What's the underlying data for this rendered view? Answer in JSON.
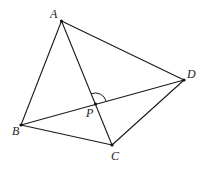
{
  "diagram": {
    "type": "quadrilateral-with-diagonals",
    "points": {
      "A": {
        "label": "A",
        "x": 61.5,
        "y": 21,
        "label_x": 50,
        "label_y": 18
      },
      "B": {
        "label": "B",
        "x": 21,
        "y": 125,
        "label_x": 12,
        "label_y": 135
      },
      "C": {
        "label": "C",
        "x": 112,
        "y": 145,
        "label_x": 111,
        "label_y": 160
      },
      "D": {
        "label": "D",
        "x": 184,
        "y": 80,
        "label_x": 187,
        "label_y": 78
      },
      "P": {
        "label": "P",
        "x": 95.5,
        "y": 104,
        "label_x": 86,
        "label_y": 117
      }
    },
    "segments": [
      {
        "name": "AB",
        "from": "A",
        "to": "B"
      },
      {
        "name": "AD",
        "from": "A",
        "to": "D"
      },
      {
        "name": "AC",
        "from": "A",
        "to": "C"
      },
      {
        "name": "BC",
        "from": "B",
        "to": "C"
      },
      {
        "name": "BD",
        "from": "B",
        "to": "D"
      },
      {
        "name": "CD",
        "from": "C",
        "to": "D"
      }
    ],
    "angle_mark": {
      "vertex": "P",
      "between": [
        "A",
        "D"
      ],
      "label": "angle APD"
    }
  }
}
